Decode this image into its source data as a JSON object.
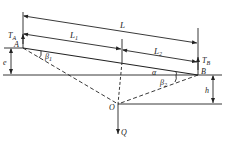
{
  "diagram": {
    "type": "cable-geometry",
    "colors": {
      "line": "#222222",
      "background": "#ffffff"
    },
    "points": {
      "A": {
        "label": "A"
      },
      "B": {
        "label": "B"
      },
      "O": {
        "label": "O"
      }
    },
    "dimensions": {
      "L": "L",
      "L1": {
        "base": "L",
        "sub": "1"
      },
      "L2": {
        "base": "L",
        "sub": "2"
      },
      "e": "e",
      "h": "h"
    },
    "forces": {
      "TA": {
        "base": "T",
        "sub": "A"
      },
      "TB": {
        "base": "T",
        "sub": "B"
      },
      "Q": "Q"
    },
    "angles": {
      "alpha": "α",
      "beta1": {
        "base": "β",
        "sub": "1"
      },
      "beta2": {
        "base": "β",
        "sub": "2"
      }
    }
  }
}
